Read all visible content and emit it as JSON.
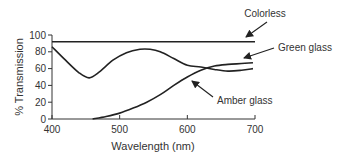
{
  "chart_data": {
    "type": "line",
    "title": "",
    "xlabel": "Wavelength (nm)",
    "ylabel": "% Transmission",
    "xlim": [
      400,
      700
    ],
    "ylim": [
      0,
      100
    ],
    "x_ticks": [
      400,
      500,
      600,
      700
    ],
    "y_ticks": [
      0,
      20,
      40,
      60,
      80,
      100
    ],
    "grid": false,
    "legend": "none (inline arrow annotations)",
    "series": [
      {
        "name": "Colorless",
        "x": [
          400,
          700
        ],
        "y": [
          92,
          92
        ]
      },
      {
        "name": "Green glass",
        "x": [
          400,
          420,
          440,
          455,
          470,
          490,
          510,
          530,
          545,
          560,
          580,
          600,
          620,
          640,
          660,
          680,
          697
        ],
        "y": [
          86,
          70,
          55,
          49,
          56,
          70,
          79,
          83,
          83,
          80,
          72,
          64,
          62,
          59,
          57,
          58,
          60
        ]
      },
      {
        "name": "Amber glass",
        "x": [
          460,
          480,
          500,
          520,
          540,
          560,
          580,
          600,
          620,
          640,
          660,
          680,
          697
        ],
        "y": [
          0,
          3,
          7,
          13,
          20,
          29,
          40,
          50,
          58,
          63,
          65,
          66,
          67
        ]
      }
    ],
    "annotations": [
      {
        "text": "Colorless",
        "points_to": "Colorless"
      },
      {
        "text": "Green glass",
        "points_to": "Green glass"
      },
      {
        "text": "Amber glass",
        "points_to": "Amber glass"
      }
    ]
  },
  "labels": {
    "xlabel": "Wavelength (nm)",
    "ylabel": "% Transmission",
    "x_ticks": [
      "400",
      "500",
      "600",
      "700"
    ],
    "y_ticks": [
      "0",
      "20",
      "40",
      "60",
      "80",
      "100"
    ],
    "annot_colorless": "Colorless",
    "annot_green": "Green glass",
    "annot_amber": "Amber glass"
  }
}
